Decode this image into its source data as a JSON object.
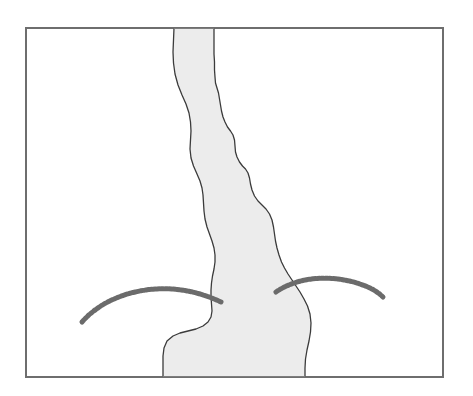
{
  "figure": {
    "title": "",
    "canvas": {
      "width": 473,
      "height": 396,
      "background_color": "#ffffff"
    },
    "frame": {
      "name": "plot-border",
      "x": 26,
      "y": 28,
      "width": 417,
      "height": 349,
      "stroke_color": "#6e6e6e",
      "stroke_width": 1.4,
      "fill_color": "#ffffff"
    },
    "shapes": [
      {
        "id": "channel-body",
        "label": "Channel body",
        "kind": "filled-polygon",
        "fill_color": "#ececec",
        "stroke_color": "#3b3b3b",
        "stroke_width": 1.3,
        "path": "M 174 28 L 173.5 40 L 173 52 L 173.5 63 L 175 74 L 178 85 L 182 95 L 186 104 L 189 113 L 190.5 122 L 191 131 L 190.5 140 L 190 149 L 191 158 L 193.5 166 L 197 174 L 200 181 L 202 188 L 203 195 L 203.5 203 L 204 211 L 205 219 L 207 227 L 209.5 234 L 212 241 L 214 248 L 215 255 L 215 262 L 214 269 L 212.5 276 L 211.5 283 L 211 290 L 211 297 L 211.5 304 L 212 311 L 211 317 L 208 322 L 203 326 L 196 329 L 188 331 L 180 333 L 173 336 L 167 341 L 164 348 L 163 356 L 163 365 L 163 377 L 305 377 L 305 368 L 305.5 359 L 307 350 L 309 341 L 310.5 332 L 311 323 L 310 314 L 307.5 306 L 304 299 L 300 292 L 296 286 L 292 280 L 288 274 L 284.5 268 L 281.5 262 L 279 255 L 277 248 L 275.5 241 L 274.5 234 L 273.5 227 L 272 220 L 269.5 214 L 266 209 L 262 205 L 258 201 L 254.5 196 L 252 190 L 250.5 184 L 249.5 178 L 248 173 L 245.5 169 L 242.5 166 L 239.5 162 L 237 157 L 235.5 152 L 235 146 L 234.5 140 L 233 135 L 230.5 131 L 227.5 127 L 225 122 L 223 117 L 221.5 111 L 220.5 105 L 219.5 99 L 218.5 93 L 217 88 L 215.5 83 L 215 77 L 214.5 70 L 214.5 62 L 214 54 L 214 45 L 214 36 L 214 28 Z"
      }
    ],
    "curves": [
      {
        "id": "contour-left",
        "label": "Left dashed arc",
        "kind": "dashed-arc",
        "stroke_color": "#6b6b6b",
        "stroke_width": 5,
        "dash_pattern": "2.4 1.6",
        "path": "M 82 322 C 96 306, 118 294, 146 290 C 174 286, 200 292, 221 302"
      },
      {
        "id": "contour-right",
        "label": "Right dashed arc",
        "kind": "dashed-arc",
        "stroke_color": "#6b6b6b",
        "stroke_width": 5,
        "dash_pattern": "2.4 1.6",
        "path": "M 276 292 C 292 281, 314 276, 338 279 C 360 282, 375 289, 383 297"
      }
    ],
    "colors": {
      "fill": "#ececec",
      "outline": "#3b3b3b",
      "dashed_line": "#6b6b6b",
      "frame": "#6e6e6e",
      "background": "#ffffff"
    },
    "legend": {
      "visible": false,
      "entries": []
    },
    "axes": {
      "visible": false,
      "x_ticks": [],
      "y_ticks": [],
      "xlabel": "",
      "ylabel": ""
    },
    "annotations": []
  }
}
